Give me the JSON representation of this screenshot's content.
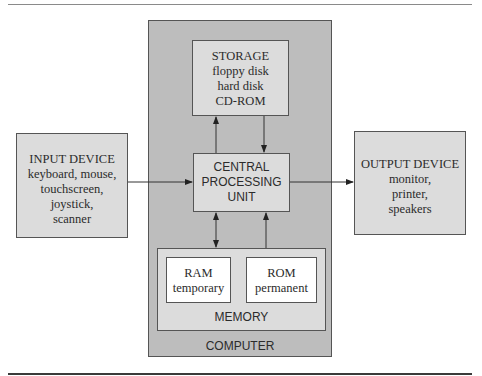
{
  "diagram": {
    "computer": {
      "label": "COMPUTER"
    },
    "storage": {
      "title": "STORAGE",
      "items": [
        "floppy disk",
        "hard disk",
        "CD-ROM"
      ]
    },
    "cpu": {
      "lines": [
        "CENTRAL",
        "PROCESSING",
        "UNIT"
      ]
    },
    "input": {
      "title": "INPUT DEVICE",
      "items": [
        "keyboard, mouse,",
        "touchscreen,",
        "joystick,",
        "scanner"
      ]
    },
    "output": {
      "title": "OUTPUT DEVICE",
      "items": [
        "monitor,",
        "printer,",
        "speakers"
      ]
    },
    "memory": {
      "label": "MEMORY",
      "ram": {
        "title": "RAM",
        "subtitle": "temporary"
      },
      "rom": {
        "title": "ROM",
        "subtitle": "permanent"
      }
    },
    "connections": [
      {
        "from": "input",
        "to": "cpu",
        "direction": "one-way"
      },
      {
        "from": "cpu",
        "to": "output",
        "direction": "one-way"
      },
      {
        "from": "cpu",
        "to": "storage",
        "direction": "one-way"
      },
      {
        "from": "storage",
        "to": "cpu",
        "direction": "one-way"
      },
      {
        "from": "cpu",
        "to": "memory",
        "direction": "two-way"
      },
      {
        "from": "memory",
        "to": "cpu",
        "direction": "one-way"
      }
    ]
  }
}
